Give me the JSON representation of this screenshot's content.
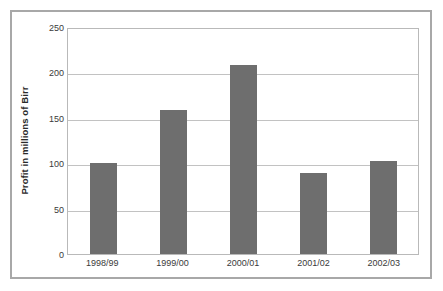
{
  "chart_data": {
    "type": "bar",
    "title": "",
    "xlabel": "",
    "ylabel": "Profit in millions of Birr",
    "categories": [
      "1998/99",
      "1999/00",
      "2000/01",
      "2001/02",
      "2002/03"
    ],
    "values": [
      100,
      159,
      208,
      89,
      102
    ],
    "ylim": [
      0,
      250
    ],
    "yticks": [
      0,
      50,
      100,
      150,
      200,
      250
    ],
    "ytick_labels": [
      "0",
      "50",
      "100",
      "150",
      "200",
      "250"
    ],
    "grid": true,
    "legend": false,
    "legend_position": "none",
    "series": [
      {
        "name": "Profit",
        "values": [
          100,
          159,
          208,
          89,
          102
        ],
        "color": "#6e6e6e"
      }
    ]
  },
  "style": {
    "bar_color": "#6e6e6e",
    "gridline_color": "#c2c2c2",
    "plot_border_color": "#b9b9b9",
    "frame_border_color": "#a8a8a8",
    "background": "#ffffff",
    "text_color": "#3a3a3a"
  }
}
